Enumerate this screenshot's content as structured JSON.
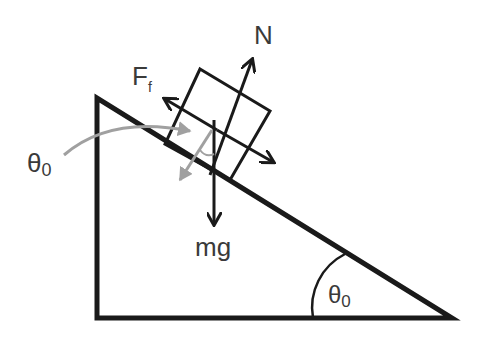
{
  "diagram": {
    "labels": {
      "normal_force": "N",
      "friction_force": "F",
      "friction_sub": "f",
      "weight": "mg",
      "angle_left": "θ",
      "angle_left_sub": "0",
      "angle_incline": "θ",
      "angle_incline_sub": "0"
    },
    "colors": {
      "stroke": "#1a1a1a",
      "annotation": "#a0a0a0",
      "text": "#3a3a3a",
      "background": "#ffffff"
    }
  }
}
